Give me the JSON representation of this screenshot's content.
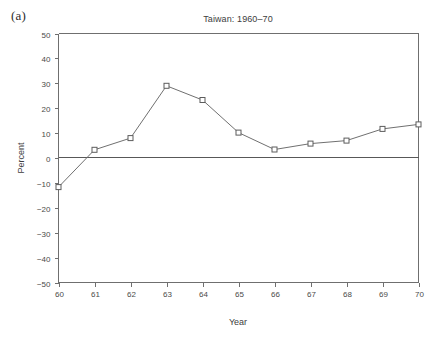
{
  "figure": {
    "panel_label": "(a)",
    "background_color": "#ffffff",
    "line_color": "#707070",
    "axis_color": "#6f6f6f",
    "text_color": "#3d3d3d"
  },
  "chart_data": {
    "type": "line",
    "title": "Taiwan: 1960–70",
    "xlabel": "Year",
    "ylabel": "Percent",
    "x": [
      60,
      61,
      62,
      63,
      64,
      65,
      66,
      67,
      68,
      69,
      70
    ],
    "values": [
      -11.7,
      3.3,
      8.0,
      29.0,
      23.3,
      10.2,
      3.4,
      5.8,
      7.0,
      11.7,
      13.5
    ],
    "xtick_labels": [
      "60",
      "61",
      "62",
      "63",
      "64",
      "65",
      "66",
      "67",
      "68",
      "69",
      "70"
    ],
    "ytick_labels": [
      "50",
      "40",
      "30",
      "20",
      "10",
      "0",
      "−10",
      "−20",
      "−30",
      "−40",
      "−50"
    ],
    "yticks": [
      50,
      40,
      30,
      20,
      10,
      0,
      -10,
      -20,
      -30,
      -40,
      -50
    ],
    "xlim": [
      60,
      70
    ],
    "ylim": [
      -50,
      50
    ],
    "grid": false,
    "legend": "none",
    "marker": "open-square",
    "zero_reference_line": 0
  }
}
